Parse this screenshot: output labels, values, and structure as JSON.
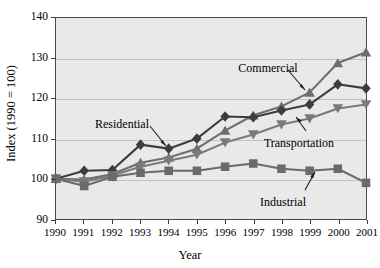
{
  "chart_data": {
    "type": "line",
    "title": "",
    "xlabel": "Year",
    "ylabel": "Index (1990 = 100)",
    "x": [
      1990,
      1991,
      1992,
      1993,
      1994,
      1995,
      1996,
      1997,
      1998,
      1999,
      2000,
      2001
    ],
    "xtick_labels": [
      "1990",
      "1991",
      "1992",
      "1993",
      "1994",
      "1995",
      "1996",
      "1997",
      "1998",
      "1999",
      "2000",
      "2001"
    ],
    "ytick_labels": [
      "90",
      "100",
      "110",
      "120",
      "130",
      "140"
    ],
    "ytick_values": [
      90,
      100,
      110,
      120,
      130,
      140
    ],
    "ylim": [
      90,
      140
    ],
    "xlim": [
      1990,
      2001
    ],
    "grid": true,
    "legend_position": "inline-annotations",
    "series": [
      {
        "name": "Commercial",
        "marker": "triangle-up",
        "color": "#6e6e6e",
        "values": [
          100.0,
          99.8,
          101.2,
          104.0,
          105.3,
          107.5,
          112.0,
          115.8,
          118.0,
          121.5,
          128.8,
          131.5
        ]
      },
      {
        "name": "Residential",
        "marker": "diamond",
        "color": "#3c3c3c",
        "values": [
          100.0,
          102.0,
          102.2,
          108.5,
          107.5,
          110.0,
          115.5,
          115.3,
          117.0,
          118.5,
          123.5,
          122.5
        ]
      },
      {
        "name": "Transportation",
        "marker": "triangle-down",
        "color": "#7a7a7a",
        "values": [
          100.0,
          99.3,
          100.8,
          103.0,
          104.5,
          106.0,
          109.0,
          111.0,
          113.5,
          115.0,
          117.5,
          118.5
        ]
      },
      {
        "name": "Industrial",
        "marker": "square",
        "color": "#6a6a6a",
        "values": [
          100.0,
          98.2,
          100.5,
          101.5,
          102.0,
          102.0,
          103.0,
          103.8,
          102.5,
          102.0,
          102.5,
          99.0
        ]
      }
    ],
    "annotations": [
      {
        "label": "Commercial",
        "x": 268,
        "y": 62
      },
      {
        "label": "Residential",
        "x": 122,
        "y": 118
      },
      {
        "label": "Transportation",
        "x": 299,
        "y": 137
      },
      {
        "label": "Industrial",
        "x": 283,
        "y": 196
      }
    ],
    "colors": {
      "plot_background": "#e9e9e9",
      "gridline": "#c3c3c3",
      "axis": "#4a4a4a",
      "page_background": "#ffffff",
      "text": "#000000"
    }
  }
}
